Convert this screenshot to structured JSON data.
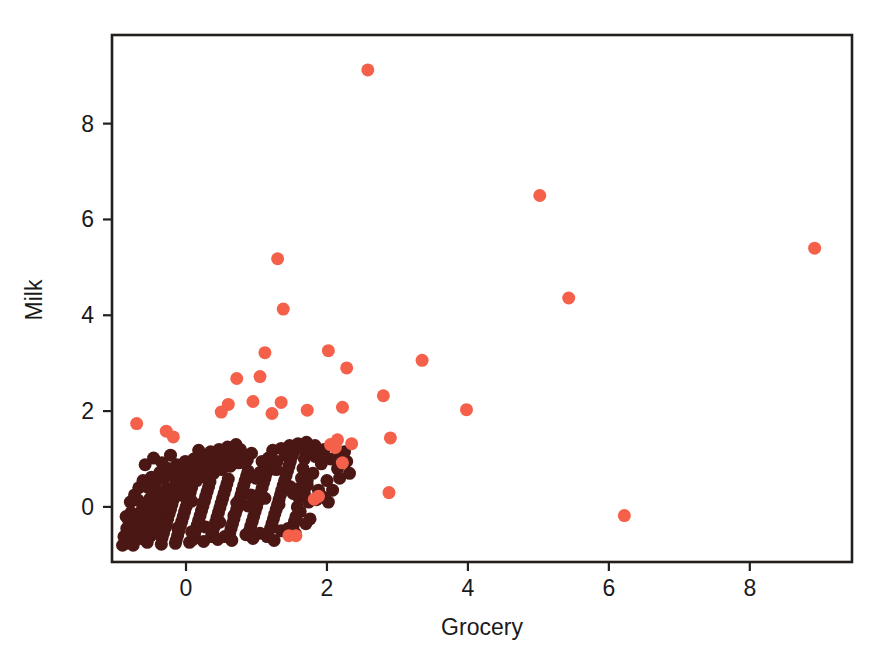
{
  "chart_data": {
    "type": "scatter",
    "title": "",
    "xlabel": "Grocery",
    "ylabel": "Milk",
    "xlim": [
      -1.05,
      9.45
    ],
    "ylim": [
      -1.15,
      9.85
    ],
    "xticks": [
      0,
      2,
      4,
      6,
      8
    ],
    "xticklabels": [
      "0",
      "2",
      "4",
      "6",
      "8"
    ],
    "yticks": [
      0,
      2,
      4,
      6,
      8
    ],
    "yticklabels": [
      "0",
      "2",
      "4",
      "6",
      "8"
    ],
    "grid": false,
    "legend": null,
    "marker": "circle",
    "marker_size_px": 13,
    "series": [
      {
        "name": "inliers",
        "color": "#4a1714",
        "points": [
          [
            -0.86,
            -0.76
          ],
          [
            -0.82,
            -0.7
          ],
          [
            -0.79,
            -0.63
          ],
          [
            -0.8,
            -0.55
          ],
          [
            -0.77,
            -0.48
          ],
          [
            -0.74,
            -0.72
          ],
          [
            -0.72,
            -0.6
          ],
          [
            -0.7,
            -0.5
          ],
          [
            -0.68,
            -0.4
          ],
          [
            -0.66,
            -0.3
          ],
          [
            -0.75,
            -0.35
          ],
          [
            -0.73,
            -0.22
          ],
          [
            -0.64,
            -0.66
          ],
          [
            -0.62,
            -0.55
          ],
          [
            -0.6,
            -0.45
          ],
          [
            -0.58,
            -0.35
          ],
          [
            -0.56,
            -0.25
          ],
          [
            -0.54,
            -0.15
          ],
          [
            -0.52,
            -0.05
          ],
          [
            -0.5,
            -0.6
          ],
          [
            -0.48,
            -0.5
          ],
          [
            -0.46,
            -0.4
          ],
          [
            -0.44,
            -0.3
          ],
          [
            -0.42,
            -0.2
          ],
          [
            -0.4,
            -0.1
          ],
          [
            -0.38,
            0.0
          ],
          [
            -0.36,
            0.1
          ],
          [
            -0.34,
            -0.65
          ],
          [
            -0.32,
            -0.55
          ],
          [
            -0.3,
            -0.45
          ],
          [
            -0.28,
            -0.35
          ],
          [
            -0.26,
            -0.25
          ],
          [
            -0.24,
            -0.15
          ],
          [
            -0.22,
            -0.05
          ],
          [
            -0.2,
            0.05
          ],
          [
            -0.18,
            0.15
          ],
          [
            -0.16,
            0.25
          ],
          [
            -0.14,
            -0.7
          ],
          [
            -0.12,
            -0.6
          ],
          [
            -0.1,
            -0.5
          ],
          [
            -0.08,
            -0.4
          ],
          [
            -0.06,
            -0.3
          ],
          [
            -0.04,
            -0.2
          ],
          [
            -0.02,
            -0.1
          ],
          [
            0.0,
            0.0
          ],
          [
            0.02,
            0.1
          ],
          [
            0.04,
            0.2
          ],
          [
            0.06,
            0.3
          ],
          [
            0.08,
            0.4
          ],
          [
            0.1,
            -0.68
          ],
          [
            0.12,
            -0.58
          ],
          [
            0.14,
            -0.48
          ],
          [
            0.16,
            -0.38
          ],
          [
            0.18,
            -0.28
          ],
          [
            0.2,
            -0.18
          ],
          [
            0.22,
            -0.08
          ],
          [
            0.24,
            0.02
          ],
          [
            0.26,
            0.12
          ],
          [
            0.28,
            0.22
          ],
          [
            0.3,
            0.32
          ],
          [
            0.32,
            0.42
          ],
          [
            0.34,
            0.52
          ],
          [
            0.36,
            -0.62
          ],
          [
            0.38,
            -0.52
          ],
          [
            0.4,
            -0.42
          ],
          [
            0.42,
            -0.32
          ],
          [
            0.44,
            -0.22
          ],
          [
            0.46,
            -0.12
          ],
          [
            0.48,
            -0.02
          ],
          [
            0.5,
            0.08
          ],
          [
            0.52,
            0.18
          ],
          [
            0.54,
            0.28
          ],
          [
            0.56,
            0.38
          ],
          [
            0.58,
            0.48
          ],
          [
            0.6,
            0.58
          ],
          [
            0.62,
            -0.55
          ],
          [
            0.64,
            -0.45
          ],
          [
            0.66,
            -0.35
          ],
          [
            0.68,
            -0.25
          ],
          [
            0.7,
            -0.15
          ],
          [
            0.72,
            -0.05
          ],
          [
            0.74,
            0.05
          ],
          [
            0.76,
            0.15
          ],
          [
            0.78,
            0.25
          ],
          [
            0.8,
            0.35
          ],
          [
            0.82,
            0.45
          ],
          [
            0.84,
            0.55
          ],
          [
            0.86,
            0.65
          ],
          [
            0.88,
            0.75
          ],
          [
            0.9,
            -0.5
          ],
          [
            0.92,
            -0.4
          ],
          [
            0.94,
            -0.3
          ],
          [
            0.96,
            -0.2
          ],
          [
            0.98,
            -0.1
          ],
          [
            1.0,
            0.0
          ],
          [
            1.02,
            0.1
          ],
          [
            1.04,
            0.2
          ],
          [
            1.06,
            0.3
          ],
          [
            1.08,
            0.4
          ],
          [
            1.1,
            0.5
          ],
          [
            1.12,
            0.6
          ],
          [
            1.14,
            0.7
          ],
          [
            1.16,
            0.8
          ],
          [
            1.18,
            0.9
          ],
          [
            1.2,
            -0.45
          ],
          [
            1.22,
            -0.35
          ],
          [
            1.24,
            -0.25
          ],
          [
            1.26,
            -0.15
          ],
          [
            1.28,
            -0.05
          ],
          [
            1.3,
            0.05
          ],
          [
            1.32,
            0.15
          ],
          [
            1.34,
            0.25
          ],
          [
            1.36,
            0.35
          ],
          [
            1.38,
            0.45
          ],
          [
            1.4,
            0.55
          ],
          [
            1.42,
            0.65
          ],
          [
            1.44,
            0.75
          ],
          [
            1.46,
            0.85
          ],
          [
            1.48,
            0.95
          ],
          [
            1.5,
            1.05
          ],
          [
            1.52,
            -0.4
          ],
          [
            1.54,
            -0.3
          ],
          [
            1.56,
            -0.2
          ],
          [
            1.58,
            0.0
          ],
          [
            1.6,
            0.2
          ],
          [
            1.62,
            0.4
          ],
          [
            1.64,
            0.6
          ],
          [
            1.66,
            0.8
          ],
          [
            1.68,
            1.0
          ],
          [
            1.7,
            1.15
          ],
          [
            1.72,
            0.45
          ],
          [
            1.74,
            0.1
          ],
          [
            1.76,
            -0.25
          ],
          [
            1.8,
            0.7
          ],
          [
            1.84,
            1.05
          ],
          [
            1.88,
            0.35
          ],
          [
            1.92,
            0.9
          ],
          [
            1.96,
            1.2
          ],
          [
            2.0,
            0.55
          ],
          [
            2.05,
            1.0
          ],
          [
            2.1,
            1.3
          ],
          [
            2.15,
            0.8
          ],
          [
            2.2,
            1.1
          ],
          [
            -0.9,
            -0.8
          ],
          [
            -0.88,
            -0.62
          ],
          [
            -0.84,
            -0.45
          ],
          [
            -0.81,
            -0.3
          ],
          [
            -0.78,
            -0.12
          ],
          [
            -0.69,
            -0.18
          ],
          [
            -0.63,
            -0.08
          ],
          [
            -0.57,
            0.05
          ],
          [
            -0.51,
            0.18
          ],
          [
            -0.45,
            0.0
          ],
          [
            -0.39,
            0.3
          ],
          [
            -0.33,
            0.18
          ],
          [
            -0.27,
            0.38
          ],
          [
            -0.21,
            0.28
          ],
          [
            -0.15,
            0.48
          ],
          [
            -0.09,
            0.38
          ],
          [
            -0.03,
            0.58
          ],
          [
            0.03,
            0.48
          ],
          [
            0.09,
            0.68
          ],
          [
            0.15,
            0.55
          ],
          [
            0.21,
            0.75
          ],
          [
            0.27,
            0.62
          ],
          [
            0.33,
            0.82
          ],
          [
            0.39,
            0.7
          ],
          [
            0.45,
            0.9
          ],
          [
            0.51,
            0.78
          ],
          [
            0.57,
            0.98
          ],
          [
            0.63,
            0.85
          ],
          [
            0.69,
            1.02
          ],
          [
            0.75,
            0.92
          ],
          [
            0.81,
            1.1
          ],
          [
            0.87,
            0.98
          ],
          [
            0.93,
            1.12
          ],
          [
            0.99,
            0.6
          ],
          [
            1.05,
            0.72
          ],
          [
            1.11,
            0.88
          ],
          [
            1.17,
            1.02
          ],
          [
            1.23,
            1.18
          ],
          [
            1.29,
            0.95
          ],
          [
            1.35,
            1.22
          ],
          [
            1.41,
            1.08
          ],
          [
            1.47,
            1.28
          ],
          [
            1.53,
            1.15
          ],
          [
            1.59,
            1.32
          ],
          [
            1.65,
            1.22
          ],
          [
            1.71,
            1.35
          ],
          [
            1.77,
            1.18
          ],
          [
            1.83,
            1.28
          ],
          [
            1.89,
            1.1
          ],
          [
            -0.85,
            -0.2
          ],
          [
            -0.79,
            0.1
          ],
          [
            -0.73,
            0.25
          ],
          [
            -0.67,
            0.4
          ],
          [
            -0.61,
            0.55
          ],
          [
            -0.55,
            0.42
          ],
          [
            -0.49,
            0.62
          ],
          [
            -0.43,
            0.5
          ],
          [
            -0.37,
            0.72
          ],
          [
            -0.31,
            0.6
          ],
          [
            -0.25,
            0.8
          ],
          [
            -0.19,
            0.68
          ],
          [
            -0.13,
            0.88
          ],
          [
            -0.07,
            0.75
          ],
          [
            -0.01,
            0.95
          ],
          [
            0.05,
            0.82
          ],
          [
            0.11,
            1.0
          ],
          [
            0.17,
            0.9
          ],
          [
            0.23,
            1.05
          ],
          [
            0.29,
            0.95
          ],
          [
            -0.58,
            0.88
          ],
          [
            -0.46,
            1.02
          ],
          [
            -0.34,
            0.92
          ],
          [
            -0.22,
            1.08
          ],
          [
            0.35,
            1.15
          ],
          [
            0.41,
            1.05
          ],
          [
            0.47,
            1.2
          ],
          [
            0.53,
            1.1
          ],
          [
            0.59,
            1.25
          ],
          [
            0.65,
            1.15
          ],
          [
            0.71,
            1.3
          ],
          [
            0.77,
            1.2
          ],
          [
            1.95,
            0.2
          ],
          [
            2.08,
            0.35
          ],
          [
            2.18,
            0.6
          ],
          [
            2.28,
            0.95
          ],
          [
            1.62,
            -0.1
          ],
          [
            1.7,
            -0.35
          ],
          [
            1.85,
            0.15
          ],
          [
            2.02,
            0.1
          ],
          [
            1.05,
            -0.55
          ],
          [
            1.15,
            -0.62
          ],
          [
            1.25,
            -0.7
          ],
          [
            0.85,
            -0.58
          ],
          [
            0.95,
            -0.66
          ],
          [
            0.55,
            -0.62
          ],
          [
            0.65,
            -0.7
          ],
          [
            0.45,
            -0.68
          ],
          [
            0.25,
            -0.72
          ],
          [
            0.05,
            -0.74
          ],
          [
            -0.15,
            -0.76
          ],
          [
            -0.35,
            -0.78
          ],
          [
            -0.55,
            -0.74
          ],
          [
            -0.75,
            -0.8
          ],
          [
            1.35,
            -0.5
          ],
          [
            1.45,
            -0.45
          ],
          [
            1.55,
            -0.55
          ],
          [
            2.25,
            1.15
          ],
          [
            2.32,
            0.7
          ],
          [
            0.42,
            0.95
          ],
          [
            0.18,
            1.18
          ],
          [
            0.08,
            0.12
          ],
          [
            -0.05,
            0.24
          ],
          [
            -0.28,
            -0.02
          ],
          [
            -0.48,
            0.34
          ],
          [
            -0.68,
            0.14
          ],
          [
            0.72,
            0.08
          ],
          [
            0.92,
            0.25
          ],
          [
            1.12,
            0.18
          ],
          [
            1.32,
            0.05
          ],
          [
            1.52,
            0.28
          ],
          [
            1.72,
            0.55
          ],
          [
            1.08,
            0.95
          ],
          [
            1.28,
            0.78
          ],
          [
            1.48,
            0.42
          ],
          [
            1.68,
            0.28
          ],
          [
            0.88,
            0.02
          ],
          [
            0.68,
            -0.18
          ],
          [
            0.48,
            -0.32
          ],
          [
            0.28,
            -0.42
          ],
          [
            0.08,
            -0.52
          ],
          [
            -0.12,
            -0.44
          ],
          [
            -0.32,
            -0.38
          ],
          [
            -0.52,
            -0.28
          ]
        ]
      },
      {
        "name": "outliers",
        "color": "#f4604a",
        "points": [
          [
            2.58,
            9.12
          ],
          [
            5.02,
            6.5
          ],
          [
            8.92,
            5.4
          ],
          [
            5.43,
            4.36
          ],
          [
            1.3,
            5.18
          ],
          [
            1.38,
            4.13
          ],
          [
            1.12,
            3.22
          ],
          [
            2.02,
            3.26
          ],
          [
            3.35,
            3.06
          ],
          [
            2.28,
            2.9
          ],
          [
            0.72,
            2.68
          ],
          [
            1.05,
            2.72
          ],
          [
            0.95,
            2.2
          ],
          [
            1.35,
            2.18
          ],
          [
            2.8,
            2.32
          ],
          [
            0.6,
            2.14
          ],
          [
            3.98,
            2.03
          ],
          [
            2.22,
            2.08
          ],
          [
            1.72,
            2.02
          ],
          [
            -0.7,
            1.74
          ],
          [
            -0.28,
            1.58
          ],
          [
            -0.18,
            1.46
          ],
          [
            2.9,
            1.44
          ],
          [
            2.15,
            1.4
          ],
          [
            2.12,
            1.24
          ],
          [
            2.05,
            1.3
          ],
          [
            2.22,
            0.92
          ],
          [
            1.88,
            0.22
          ],
          [
            1.82,
            0.16
          ],
          [
            2.88,
            0.3
          ],
          [
            6.22,
            -0.18
          ],
          [
            1.46,
            -0.6
          ],
          [
            1.56,
            -0.6
          ],
          [
            0.5,
            1.98
          ],
          [
            1.22,
            1.95
          ],
          [
            2.35,
            1.32
          ]
        ]
      }
    ]
  },
  "axes": {
    "frame_color": "#231f1d",
    "background": "#ffffff"
  }
}
